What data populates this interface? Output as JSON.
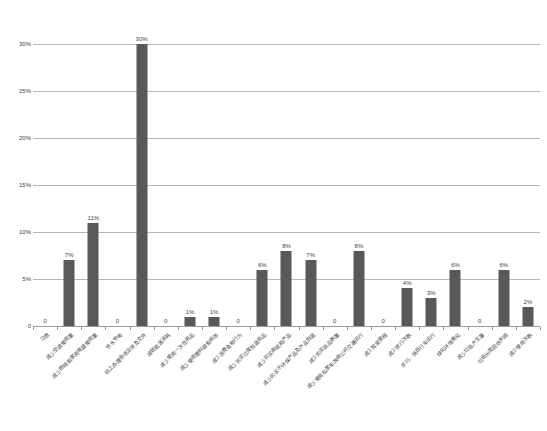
{
  "chart_data": {
    "type": "bar",
    "title": "",
    "subtitle": "",
    "xlabel": "",
    "ylabel": "",
    "ylim": [
      0,
      30
    ],
    "ytick_labels": [
      "30%",
      "25%",
      "20%",
      "15%",
      "10%",
      "5%",
      "0"
    ],
    "ytick_values": [
      30,
      25,
      20,
      15,
      10,
      5,
      0
    ],
    "grid": true,
    "legend": false,
    "legend_position": "none",
    "value_label_format": "percent-integer",
    "bar_color": "#595959",
    "gridline_color": "#b7b7b7",
    "axis_color": "#9a9a9a",
    "text_color": "#3f3f3f",
    "categories": [
      "习惯",
      "减少空调使用量",
      "减少照明和家用电器使用量",
      "节水节电",
      "网上办理各项业务及文件",
      "减轻能源消耗",
      "减少使用一次性用品",
      "减少使用塑料袋和纸张",
      "减少浪费食物行为",
      "减少购买过度包装商品",
      "减少购买高能耗产品",
      "减少购买不环保产品及产品包装",
      "减少购买商品数量",
      "减少使用私家车改用公共交通出行",
      "减少驾驶里程",
      "减少旅行次数",
      "步行、骑自行车出行",
      "绿化环境美化",
      "减少垃圾产生量",
      "垃圾分类回收利用",
      "减少使用次数"
    ],
    "values": [
      0,
      7,
      11,
      0,
      30,
      0,
      1,
      1,
      0,
      6,
      8,
      7,
      0,
      8,
      0,
      4,
      3,
      6,
      0,
      6,
      2
    ],
    "value_labels": [
      "0",
      "7%",
      "11%",
      "0",
      "30%",
      "0",
      "1%",
      "1%",
      "0",
      "6%",
      "8%",
      "7%",
      "0",
      "8%",
      "0",
      "4%",
      "3%",
      "6%",
      "0",
      "6%",
      "2%"
    ],
    "series": [
      {
        "name": "占比",
        "values": [
          0,
          7,
          11,
          0,
          30,
          0,
          1,
          1,
          0,
          6,
          8,
          7,
          0,
          8,
          0,
          4,
          3,
          6,
          0,
          6,
          2
        ]
      }
    ]
  }
}
